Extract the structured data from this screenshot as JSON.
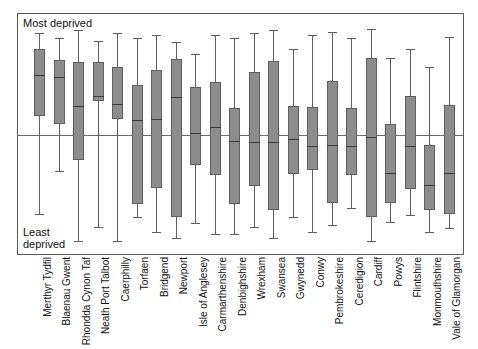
{
  "figure": {
    "annotation_top": "Most deprived",
    "annotation_bottom": "Least\ndeprived",
    "accent_box_fill": "#8d8d8d",
    "accent_box_stroke": "#5e5e5e",
    "median_color": "#3a3a3a",
    "frame_color": "#5a5a5a",
    "reference_line_color": "#6a6a6a"
  },
  "chart_data": {
    "type": "box",
    "title": "",
    "subtitle": "",
    "xlabel": "",
    "ylabel": "",
    "ylim": [
      -100,
      100
    ],
    "grid": false,
    "legend": "none",
    "annotations": [
      {
        "text": "Most deprived",
        "position": "top-left-inside"
      },
      {
        "text": "Least deprived",
        "position": "bottom-left-inside"
      }
    ],
    "reference_line": {
      "y": 0,
      "orientation": "horizontal"
    },
    "axis_note": "Vertical scale is a relative deprivation rank; higher = more deprived. Values estimated from pixel positions, reference line = 0.",
    "categories": [
      "Merthyr Tydfil",
      "Blaenau Gwent",
      "Rhondda Cynon Taf",
      "Neath Port Talbot",
      "Caerphilly",
      "Torfaen",
      "Bridgend",
      "Newport",
      "Isle of Anglesey",
      "Carmarthenshire",
      "Denbighshire",
      "Wrexham",
      "Swansea",
      "Gwynedd",
      "Conwy",
      "Pembrokeshire",
      "Ceredigion",
      "Cardiff",
      "Powys",
      "Flintshire",
      "Monmouthshire",
      "Vale of Glamorgan"
    ],
    "boxes": [
      {
        "category": "Merthyr Tydfil",
        "whisker_low": -65,
        "q1": 16,
        "median": 50,
        "q3": 71,
        "whisker_high": 84
      },
      {
        "category": "Blaenau Gwent",
        "whisker_low": -30,
        "q1": 9,
        "median": 48,
        "q3": 62,
        "whisker_high": 80
      },
      {
        "category": "Rhondda Cynon Taf",
        "whisker_low": -88,
        "q1": -21,
        "median": 24,
        "q3": 60,
        "whisker_high": 87
      },
      {
        "category": "Neath Port Talbot",
        "whisker_low": -76,
        "q1": 28,
        "median": 32,
        "q3": 60,
        "whisker_high": 78
      },
      {
        "category": "Caerphilly",
        "whisker_low": -88,
        "q1": 13,
        "median": 26,
        "q3": 56,
        "whisker_high": 84
      },
      {
        "category": "Torfaen",
        "whisker_low": -68,
        "q1": -57,
        "median": 12,
        "q3": 41,
        "whisker_high": 80
      },
      {
        "category": "Bridgend",
        "whisker_low": -80,
        "q1": -44,
        "median": 13,
        "q3": 54,
        "whisker_high": 83
      },
      {
        "category": "Newport",
        "whisker_low": -85,
        "q1": -68,
        "median": 31,
        "q3": 63,
        "whisker_high": 77
      },
      {
        "category": "Isle of Anglesey",
        "whisker_low": -73,
        "q1": -25,
        "median": 2,
        "q3": 40,
        "whisker_high": 67
      },
      {
        "category": "Carmarthenshire",
        "whisker_low": -82,
        "q1": -33,
        "median": 7,
        "q3": 44,
        "whisker_high": 83
      },
      {
        "category": "Denbighshire",
        "whisker_low": -82,
        "q1": -57,
        "median": -5,
        "q3": 22,
        "whisker_high": 80
      },
      {
        "category": "Wrexham",
        "whisker_low": -76,
        "q1": -42,
        "median": -6,
        "q3": 52,
        "whisker_high": 84
      },
      {
        "category": "Swansea",
        "whisker_low": -85,
        "q1": -62,
        "median": -6,
        "q3": 61,
        "whisker_high": 87
      },
      {
        "category": "Gwynedd",
        "whisker_low": -68,
        "q1": -32,
        "median": -3,
        "q3": 24,
        "whisker_high": 71
      },
      {
        "category": "Conwy",
        "whisker_low": -80,
        "q1": -29,
        "median": -9,
        "q3": 23,
        "whisker_high": 83
      },
      {
        "category": "Pembrokeshire",
        "whisker_low": -74,
        "q1": -56,
        "median": -8,
        "q3": 45,
        "whisker_high": 85
      },
      {
        "category": "Ceredigion",
        "whisker_low": -60,
        "q1": -33,
        "median": -9,
        "q3": 22,
        "whisker_high": 80
      },
      {
        "category": "Cardiff",
        "whisker_low": -88,
        "q1": -68,
        "median": -2,
        "q3": 64,
        "whisker_high": 88
      },
      {
        "category": "Powys",
        "whisker_low": -72,
        "q1": -56,
        "median": -31,
        "q3": 9,
        "whisker_high": 64
      },
      {
        "category": "Flintshire",
        "whisker_low": -66,
        "q1": -45,
        "median": -9,
        "q3": 32,
        "whisker_high": 71
      },
      {
        "category": "Monmouthshire",
        "whisker_low": -80,
        "q1": -62,
        "median": -41,
        "q3": -8,
        "whisker_high": 56
      },
      {
        "category": "Vale of Glamorgan",
        "whisker_low": -77,
        "q1": -65,
        "median": -31,
        "q3": 25,
        "whisker_high": 81
      }
    ]
  }
}
